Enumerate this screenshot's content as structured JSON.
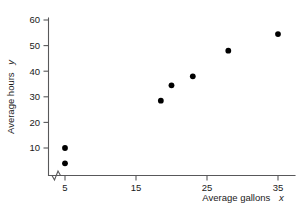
{
  "chart_data": {
    "type": "scatter",
    "title": "",
    "xlabel": "Average gallons",
    "xlabel_variable": "x",
    "ylabel": "Average hours",
    "ylabel_variable": "y",
    "xlim": [
      3,
      37
    ],
    "ylim": [
      0,
      62
    ],
    "xticks": [
      5,
      15,
      25,
      35
    ],
    "yticks": [
      10,
      20,
      30,
      40,
      50,
      60
    ],
    "xtick_labels": [
      "5",
      "15",
      "25",
      "35"
    ],
    "ytick_labels": [
      "10",
      "20",
      "30",
      "40",
      "50",
      "60"
    ],
    "grid": false,
    "legend": false,
    "axis_break_x": true,
    "points": [
      {
        "x": 5,
        "y": 4
      },
      {
        "x": 5,
        "y": 10
      },
      {
        "x": 18.5,
        "y": 28.5
      },
      {
        "x": 20,
        "y": 34.5
      },
      {
        "x": 23,
        "y": 38
      },
      {
        "x": 28,
        "y": 48
      },
      {
        "x": 35,
        "y": 54.5
      }
    ],
    "series": [
      {
        "name": "",
        "x": [
          5,
          5,
          18.5,
          20,
          23,
          28,
          35
        ],
        "values": [
          4,
          10,
          28.5,
          34.5,
          38,
          48,
          54.5
        ]
      }
    ],
    "marker_color": "#000000",
    "axis_color": "#58585a"
  }
}
